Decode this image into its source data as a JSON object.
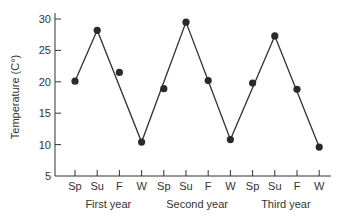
{
  "chart_data": {
    "type": "line",
    "title": "",
    "xlabel": "",
    "ylabel": "Temperature (C°)",
    "ylim": [
      5,
      30
    ],
    "yticks": [
      5,
      10,
      15,
      20,
      25,
      30
    ],
    "grid": false,
    "legend": null,
    "categories": [
      "Sp",
      "Su",
      "F",
      "W",
      "Sp",
      "Su",
      "F",
      "W",
      "Sp",
      "Su",
      "F",
      "W"
    ],
    "groups": [
      {
        "label": "First year",
        "start": 0,
        "end": 3
      },
      {
        "label": "Second year",
        "start": 4,
        "end": 7
      },
      {
        "label": "Third year",
        "start": 8,
        "end": 11
      }
    ],
    "series": [
      {
        "name": "Observed temperature",
        "style": "points",
        "values": [
          20.1,
          28.2,
          21.5,
          10.4,
          18.9,
          29.5,
          20.2,
          10.8,
          19.8,
          27.3,
          18.8,
          9.6
        ]
      },
      {
        "name": "Trend line",
        "style": "line",
        "points": [
          [
            0,
            20.1
          ],
          [
            1,
            28.2
          ],
          [
            3,
            10.4
          ],
          [
            5,
            29.5
          ],
          [
            7,
            10.8
          ],
          [
            9,
            27.3
          ],
          [
            11,
            9.6
          ]
        ]
      }
    ],
    "colors": {
      "marker": "#2a2a2a",
      "line": "#333333",
      "axis": "#333333"
    }
  }
}
